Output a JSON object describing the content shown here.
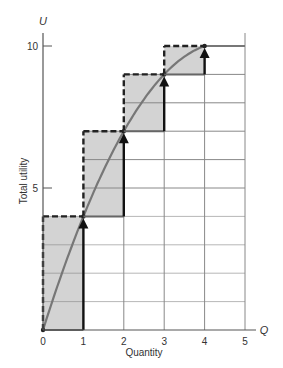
{
  "chart_data": {
    "type": "line",
    "title": "",
    "xlabel": "Quantity",
    "ylabel": "Total utility",
    "x_axis_symbol": "Q",
    "y_axis_symbol": "U",
    "x_ticks": [
      "0",
      "1",
      "2",
      "3",
      "4",
      "5"
    ],
    "y_ticks": [
      "5",
      "10"
    ],
    "xlim": [
      0,
      5
    ],
    "ylim": [
      0,
      10
    ],
    "grid": true,
    "series": [
      {
        "name": "Total utility curve",
        "style": "smooth gray curve",
        "x": [
          0,
          1,
          2,
          3,
          4,
          5
        ],
        "values": [
          0,
          4,
          7,
          9,
          10,
          10
        ]
      },
      {
        "name": "Marginal utility steps (shaded bars)",
        "style": "shaded step with dashed outline and upward arrows",
        "x": [
          1,
          2,
          3,
          4
        ],
        "increments": [
          4,
          3,
          2,
          1
        ],
        "tops": [
          4,
          7,
          9,
          10
        ]
      }
    ],
    "annotations": [
      "upward arrows at Q=1,2,3,4 pointing to total utility points"
    ]
  },
  "colors": {
    "shade": "#d3d3d3",
    "curve": "#777777",
    "axis": "#555555",
    "grid": "#888888",
    "outline": "#222222"
  }
}
